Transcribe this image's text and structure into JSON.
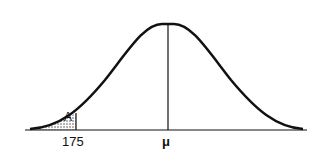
{
  "diagram": {
    "type": "normal-distribution-curve",
    "shaded_region_label": "A",
    "x_tick_label": "175",
    "mean_label": "μ",
    "colors": {
      "line": "#111111",
      "background": "#ffffff",
      "shading": "#444444"
    }
  }
}
